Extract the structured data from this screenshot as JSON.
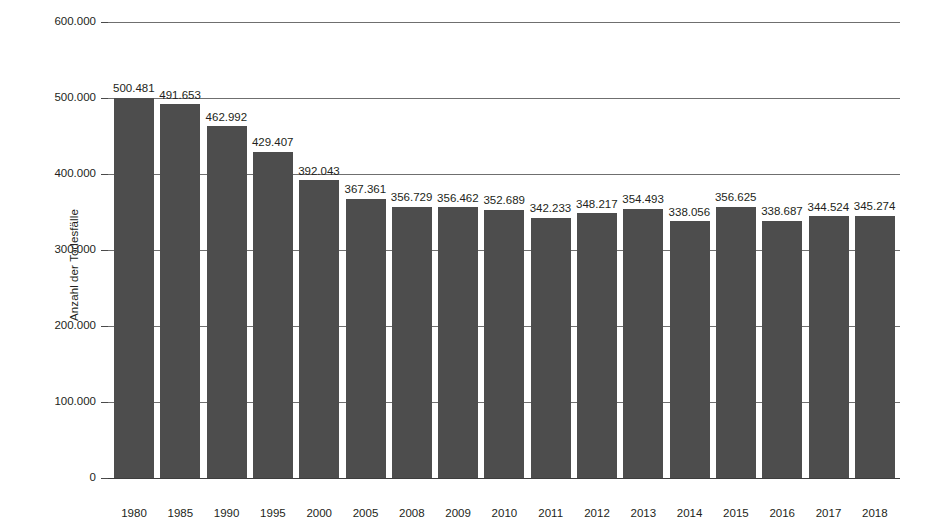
{
  "chart_data": {
    "type": "bar",
    "title": "",
    "xlabel": "",
    "ylabel": "Anzahl der Todesfälle",
    "ylim": [
      0,
      600000
    ],
    "grid": true,
    "legend": null,
    "y_ticks": [
      "0",
      "100.000",
      "200.000",
      "300.000",
      "400.000",
      "500.000",
      "600.000"
    ],
    "y_tick_values": [
      0,
      100000,
      200000,
      300000,
      400000,
      500000,
      600000
    ],
    "categories": [
      "1980",
      "1985",
      "1990",
      "1995",
      "2000",
      "2005",
      "2008",
      "2009",
      "2010",
      "2011",
      "2012",
      "2013",
      "2014",
      "2015",
      "2016",
      "2017",
      "2018"
    ],
    "values": [
      500481,
      491653,
      462992,
      429407,
      392043,
      367361,
      356729,
      356462,
      352689,
      342233,
      348217,
      354493,
      338056,
      356625,
      338687,
      344524,
      345274
    ],
    "value_labels": [
      "500.481",
      "491.653",
      "462.992",
      "429.407",
      "392.043",
      "367.361",
      "356.729",
      "356.462",
      "352.689",
      "342.233",
      "348.217",
      "354.493",
      "338.056",
      "356.625",
      "338.687",
      "344.524",
      "345.274"
    ],
    "bar_color": "#4d4d4d",
    "grid_color": "#6f6f6f",
    "text_color": "#231f20",
    "background": "#ffffff"
  }
}
